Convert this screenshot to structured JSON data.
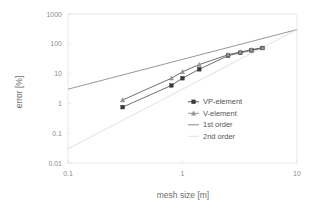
{
  "chart_data": {
    "type": "line",
    "title": "",
    "xlabel": "mesh size [m]",
    "ylabel": "error [%]",
    "xscale": "log",
    "yscale": "log",
    "xlim": [
      0.1,
      10
    ],
    "ylim": [
      0.01,
      1000
    ],
    "xticks": [
      "0.1",
      "1",
      "10"
    ],
    "xtick_values": [
      0.1,
      1,
      10
    ],
    "yticks": [
      "0.01",
      "0.1",
      "1",
      "10",
      "100",
      "1000"
    ],
    "ytick_values": [
      0.01,
      0.1,
      1,
      10,
      100,
      1000
    ],
    "grid": false,
    "legend_position": "center-right",
    "series": [
      {
        "name": "VP-element",
        "marker": "square",
        "color": "#3a3a3a",
        "x": [
          0.3,
          0.8,
          1.0,
          1.4,
          2.5,
          3.2,
          4.0,
          5.0
        ],
        "values": [
          0.75,
          4.0,
          7.0,
          14.0,
          40.0,
          50.0,
          60.0,
          72.0
        ]
      },
      {
        "name": "V-element",
        "marker": "triangle",
        "color": "#9a9a9a",
        "x": [
          0.3,
          0.8,
          1.0,
          1.4,
          2.5,
          3.2,
          4.0,
          5.0
        ],
        "values": [
          1.3,
          7.0,
          11.5,
          20.0,
          43.0,
          53.0,
          63.0,
          75.0
        ]
      },
      {
        "name": "1st order",
        "marker": "none",
        "color": "#7d7d7d",
        "x": [
          0.1,
          10
        ],
        "values": [
          3.0,
          300.0
        ]
      },
      {
        "name": "2nd order",
        "marker": "none",
        "color": "#dcdcdc",
        "x": [
          0.1,
          10
        ],
        "values": [
          0.03,
          300.0
        ]
      }
    ],
    "legend": [
      "VP-element",
      "V-element",
      "1st order",
      "2nd order"
    ]
  },
  "colors": {
    "background": "#ffffff",
    "frame": "#e2e2e2",
    "tick_text": "#8c8c8c",
    "axis_title": "#6e6e6e",
    "vp_element": "#3a3a3a",
    "v_element": "#9a9a9a",
    "first_order": "#7d7d7d",
    "second_order": "#dcdcdc"
  }
}
